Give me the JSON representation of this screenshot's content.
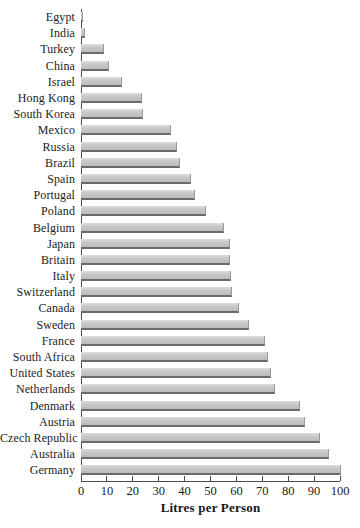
{
  "chart_data": {
    "type": "bar",
    "orientation": "horizontal",
    "title": "",
    "xlabel": "Litres per Person",
    "ylabel": "",
    "xlim": [
      0,
      100
    ],
    "xticks": [
      0,
      10,
      20,
      30,
      40,
      50,
      60,
      70,
      80,
      90,
      100
    ],
    "grid": false,
    "legend": false,
    "sort_order": "ascending-top-to-bottom",
    "categories": [
      "Egypt",
      "India",
      "Turkey",
      "China",
      "Israel",
      "Hong Kong",
      "South Korea",
      "Mexico",
      "Russia",
      "Brazil",
      "Spain",
      "Portugal",
      "Poland",
      "Belgium",
      "Japan",
      "Britain",
      "Italy",
      "Switzerland",
      "Canada",
      "Sweden",
      "France",
      "South Africa",
      "United States",
      "Netherlands",
      "Denmark",
      "Austria",
      "Czech Republic",
      "Australia",
      "Germany"
    ],
    "values": [
      0.5,
      1,
      8.5,
      10.5,
      15.5,
      23,
      23.5,
      34.5,
      36.5,
      38,
      42,
      43.5,
      48,
      55,
      57,
      57,
      57.5,
      58,
      60.5,
      64.5,
      70.5,
      72,
      73,
      74.5,
      84,
      86,
      92,
      95.5,
      100
    ],
    "colors": {
      "bar_fill": "#c8c8c8",
      "bar_highlight": "#dedede",
      "bar_shadow": "#6b6b6b",
      "axis": "#4d4d4d",
      "text": "#1c1c1c"
    }
  }
}
